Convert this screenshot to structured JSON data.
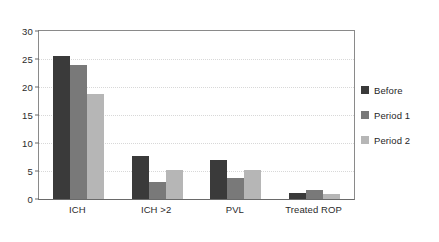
{
  "chart_data": {
    "type": "bar",
    "title": "",
    "subtitle": "",
    "xlabel": "",
    "ylabel": "",
    "categories": [
      "ICH",
      "ICH >2",
      "PVL",
      "Treated ROP"
    ],
    "series": [
      {
        "name": "Before",
        "color": "#3a3a3a",
        "values": [
          25.5,
          7.7,
          6.9,
          1.1
        ]
      },
      {
        "name": "Period 1",
        "color": "#797979",
        "values": [
          24.0,
          3.1,
          3.8,
          1.6
        ]
      },
      {
        "name": "Period 2",
        "color": "#b6b6b6",
        "values": [
          18.8,
          5.2,
          5.2,
          0.9
        ]
      }
    ],
    "ylim": [
      0,
      30
    ],
    "yticks": [
      0,
      5,
      10,
      15,
      20,
      25,
      30
    ],
    "ytick_labels": [
      "0",
      "5",
      "10",
      "15",
      "20",
      "25",
      "30"
    ],
    "grid": true,
    "grid_axis": "y",
    "grid_style": "dotted",
    "grid_color": "#d8d8d8",
    "legend_position": "right",
    "frame_color": "#8a8a8a",
    "background": "#ffffff"
  },
  "legend": {
    "items": [
      {
        "label": "Before"
      },
      {
        "label": "Period 1"
      },
      {
        "label": "Period 2"
      }
    ]
  }
}
